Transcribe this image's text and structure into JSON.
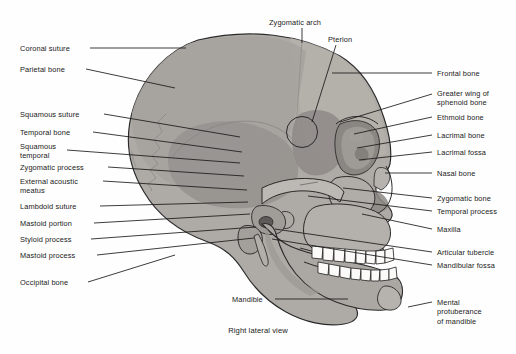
{
  "figure": {
    "caption": "Right lateral view",
    "background_color": "#fefefe",
    "line_color": "#1a1a1a",
    "text_color": "#1a1a1a"
  },
  "palette": {
    "cranium_fill": "#a8a49f",
    "cranium_dark": "#8e8a85",
    "face_fill": "#b3afaa",
    "face_light": "#c3bfba",
    "mandible_fill": "#aeaaa5",
    "teeth_fill": "#fbfaf8",
    "orbit_dark": "#6e6a66",
    "outline": "#2a2a2a"
  },
  "labels_left": [
    {
      "id": "coronal-suture",
      "text": "Coronal suture",
      "x": 20,
      "y": 44,
      "leader": {
        "x1": 90,
        "y1": 48,
        "x2": 186,
        "y2": 48
      }
    },
    {
      "id": "parietal-bone",
      "text": "Parietal bone",
      "x": 20,
      "y": 65,
      "leader": {
        "x1": 86,
        "y1": 69,
        "x2": 175,
        "y2": 88
      }
    },
    {
      "id": "squamous-suture",
      "text": "Squamous suture",
      "x": 20,
      "y": 110,
      "leader": {
        "x1": 104,
        "y1": 114,
        "x2": 240,
        "y2": 137
      }
    },
    {
      "id": "temporal-bone",
      "text": "Temporal bone",
      "x": 20,
      "y": 128,
      "leader": {
        "x1": 93,
        "y1": 132,
        "x2": 242,
        "y2": 152
      }
    },
    {
      "id": "squamous-temporal",
      "text": "Squamous\ntemporal",
      "x": 20,
      "y": 142,
      "leader": {
        "x1": 67,
        "y1": 150,
        "x2": 240,
        "y2": 163
      }
    },
    {
      "id": "zygomatic-process",
      "text": "Zygomatic process",
      "x": 20,
      "y": 163,
      "leader": {
        "x1": 108,
        "y1": 167,
        "x2": 244,
        "y2": 176
      }
    },
    {
      "id": "external-acoustic-meatus",
      "text": "External acoustic\nmeatus",
      "x": 20,
      "y": 177,
      "leader": {
        "x1": 103,
        "y1": 181,
        "x2": 247,
        "y2": 190
      }
    },
    {
      "id": "lambdoid-suture",
      "text": "Lambdoid suture",
      "x": 20,
      "y": 202,
      "leader": {
        "x1": 100,
        "y1": 206,
        "x2": 248,
        "y2": 202
      }
    },
    {
      "id": "mastoid-portion",
      "text": "Mastoid portion",
      "x": 20,
      "y": 219,
      "leader": {
        "x1": 94,
        "y1": 223,
        "x2": 250,
        "y2": 214
      }
    },
    {
      "id": "styloid-process",
      "text": "Styloid process",
      "x": 20,
      "y": 235,
      "leader": {
        "x1": 91,
        "y1": 239,
        "x2": 256,
        "y2": 227
      }
    },
    {
      "id": "mastoid-process",
      "text": "Mastoid process",
      "x": 20,
      "y": 251,
      "leader": {
        "x1": 97,
        "y1": 255,
        "x2": 254,
        "y2": 238
      }
    },
    {
      "id": "occipital-bone",
      "text": "Occipital bone",
      "x": 20,
      "y": 278,
      "leader": {
        "x1": 88,
        "y1": 282,
        "x2": 175,
        "y2": 255
      }
    }
  ],
  "labels_right": [
    {
      "id": "frontal-bone",
      "text": "Frontal bone",
      "x": 437,
      "y": 69,
      "leader": {
        "x1": 332,
        "y1": 73,
        "x2": 432,
        "y2": 73
      }
    },
    {
      "id": "greater-wing-of-sphenoid-bone",
      "text": "Greater wing of\nsphenoid bone",
      "x": 437,
      "y": 89,
      "leader": {
        "x1": 340,
        "y1": 122,
        "x2": 432,
        "y2": 94
      }
    },
    {
      "id": "ethmoid-bone",
      "text": "Ethmoid bone",
      "x": 437,
      "y": 113,
      "leader": {
        "x1": 354,
        "y1": 134,
        "x2": 432,
        "y2": 117
      }
    },
    {
      "id": "lacrimal-bone",
      "text": "Lacrimal bone",
      "x": 437,
      "y": 131,
      "leader": {
        "x1": 357,
        "y1": 148,
        "x2": 432,
        "y2": 135
      }
    },
    {
      "id": "lacrimal-fossa",
      "text": "Lacrimal fossa",
      "x": 437,
      "y": 148,
      "leader": {
        "x1": 359,
        "y1": 160,
        "x2": 432,
        "y2": 152
      }
    },
    {
      "id": "nasal-bone",
      "text": "Nasal bone",
      "x": 437,
      "y": 169,
      "leader": {
        "x1": 385,
        "y1": 173,
        "x2": 432,
        "y2": 173
      }
    },
    {
      "id": "zygomatic-bone",
      "text": "Zygomatic bone",
      "x": 437,
      "y": 194,
      "leader": {
        "x1": 343,
        "y1": 188,
        "x2": 432,
        "y2": 198
      }
    },
    {
      "id": "temporal-process",
      "text": "Temporal process",
      "x": 437,
      "y": 207,
      "leader": {
        "x1": 308,
        "y1": 196,
        "x2": 432,
        "y2": 211
      }
    },
    {
      "id": "maxilla",
      "text": "Maxilla",
      "x": 437,
      "y": 225,
      "leader": {
        "x1": 362,
        "y1": 214,
        "x2": 432,
        "y2": 229
      }
    },
    {
      "id": "articular-tubercle",
      "text": "Articular tubercle",
      "x": 437,
      "y": 248,
      "leader": {
        "x1": 275,
        "y1": 229,
        "x2": 432,
        "y2": 252
      }
    },
    {
      "id": "mandibular-fossa",
      "text": "Mandibular fossa",
      "x": 437,
      "y": 261,
      "leader": {
        "x1": 272,
        "y1": 239,
        "x2": 432,
        "y2": 265
      }
    },
    {
      "id": "mental-protuberance-of-mandible",
      "text": "Mental\nprotuberance\nof mandible",
      "x": 437,
      "y": 298,
      "leader": {
        "x1": 408,
        "y1": 307,
        "x2": 432,
        "y2": 302
      }
    }
  ],
  "labels_top": [
    {
      "id": "zygomatic-arch",
      "text": "Zygomatic arch",
      "x": 269,
      "y": 18,
      "leader": {
        "x1": 302,
        "y1": 28,
        "x2": 302,
        "y2": 43
      }
    },
    {
      "id": "pterion",
      "text": "Pterion",
      "x": 328,
      "y": 35,
      "leader": {
        "x1": 336,
        "y1": 45,
        "x2": 312,
        "y2": 122
      }
    }
  ],
  "labels_bottom": [
    {
      "id": "mandible",
      "text": "Mandible",
      "x": 232,
      "y": 295,
      "leader": {
        "x1": 275,
        "y1": 299,
        "x2": 348,
        "y2": 299
      }
    }
  ],
  "caption_position": {
    "x": 216,
    "y": 326
  }
}
